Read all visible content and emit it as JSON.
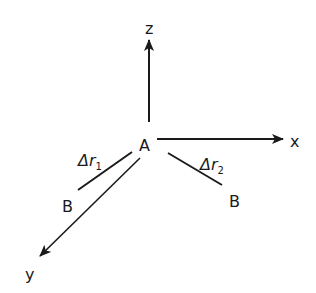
{
  "diagram": {
    "origin_label": "A",
    "axes": [
      {
        "name": "z",
        "label": "z"
      },
      {
        "name": "x",
        "label": "x"
      },
      {
        "name": "y",
        "label": "y"
      }
    ],
    "vectors": [
      {
        "symbol": "Δr",
        "subscript": "1",
        "end_label": "B"
      },
      {
        "symbol": "Δr",
        "subscript": "2",
        "end_label": "B"
      }
    ],
    "colors": {
      "stroke": "#1a1a1a",
      "background": "#ffffff"
    }
  }
}
